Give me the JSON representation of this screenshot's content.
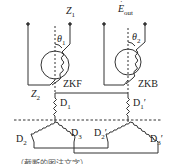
{
  "figure": {
    "left_unit": {
      "name": "ZKF",
      "top_terminal": "Z",
      "top_terminal_sub": "1",
      "bottom_terminal": "Z",
      "bottom_terminal_sub": "2",
      "angle": "θ",
      "angle_sub": "1"
    },
    "right_unit": {
      "name": "ZKB",
      "output": "E",
      "output_sub": "out",
      "angle": "θ",
      "angle_sub": "2"
    },
    "windings": {
      "D1": {
        "main": "D",
        "sub": "1",
        "prime": ""
      },
      "D1p": {
        "main": "D",
        "sub": "1",
        "prime": "′"
      },
      "D2": {
        "main": "D",
        "sub": "2",
        "prime": ""
      },
      "D3": {
        "main": "D",
        "sub": "3",
        "prime": ""
      },
      "D2p": {
        "main": "D",
        "sub": "2",
        "prime": "′"
      },
      "D3p": {
        "main": "D",
        "sub": "3",
        "prime": "′"
      }
    },
    "caption": "……（截断的图注文字）"
  },
  "colors": {
    "line": "#333333",
    "text": "#222222",
    "background": "#ffffff"
  }
}
